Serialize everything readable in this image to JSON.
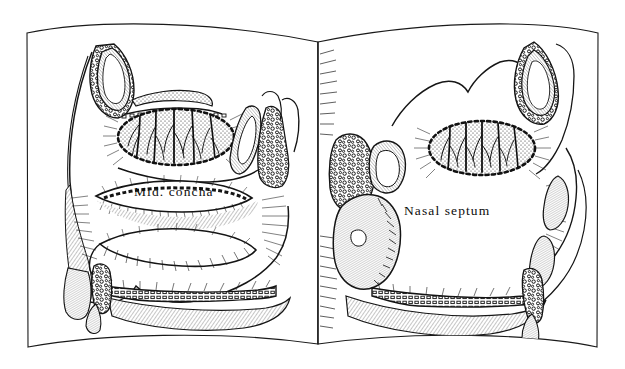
{
  "illustration": {
    "title": "Sagittal sections of the nasal cavity",
    "medium": "pen-and-ink line drawing",
    "presentation": "open book, two facing pages",
    "ink_color": "#101010",
    "page_color": "#ffffff"
  },
  "left_page": {
    "name": "left-page",
    "label": "Mid. concha",
    "view": "lateral nasal wall with conchae"
  },
  "right_page": {
    "name": "right-page",
    "label": "Nasal septum",
    "view": "nasal septum, medial wall"
  },
  "structures": {
    "frontal_sinus": "frontal-sinus",
    "olfactory_region": "olfactory-region",
    "sphenoid_sinus": "sphenoid-sinus",
    "middle_concha": "middle-concha",
    "inferior_concha": "inferior-concha",
    "hard_palate": "hard-palate",
    "nasal_septum": "nasal-septum",
    "nostril": "nostril"
  }
}
